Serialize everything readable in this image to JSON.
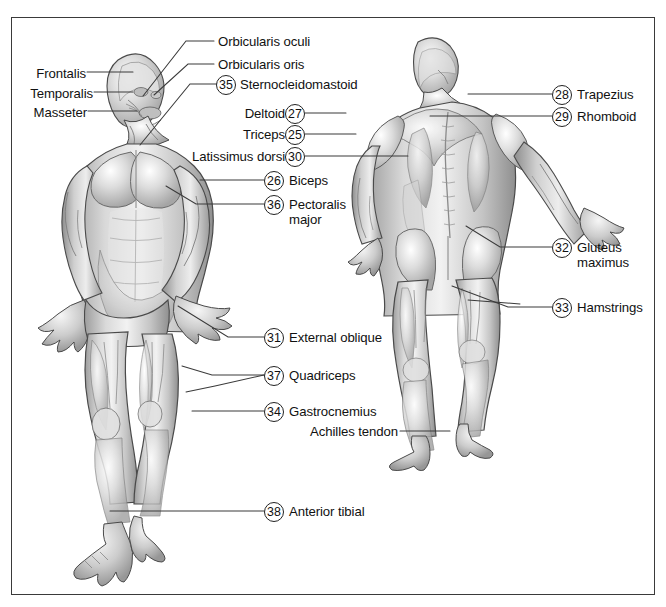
{
  "figure": {
    "border_color": "#3a3a3a",
    "background": "#ffffff",
    "leader_color": "#3a3a3a"
  },
  "views": [
    {
      "name": "anterior-figure",
      "label": "anterior view human muscular figure"
    },
    {
      "name": "posterior-figure",
      "label": "posterior view human muscular figure"
    }
  ],
  "labels": [
    {
      "id": "orbicularis-oculi",
      "text": "Orbicularis oculi",
      "number": null,
      "x": 218,
      "y": 35,
      "align": "left"
    },
    {
      "id": "orbicularis-oris",
      "text": "Orbicularis oris",
      "number": null,
      "x": 218,
      "y": 58,
      "align": "left"
    },
    {
      "id": "sternocleidomastoid",
      "text": "Sternocleidomastoid",
      "number": "35",
      "x": 238,
      "y": 78,
      "align": "left"
    },
    {
      "id": "frontalis",
      "text": "Frontalis",
      "number": null,
      "x": 26,
      "y": 66,
      "align": "left"
    },
    {
      "id": "temporalis",
      "text": "Temporalis",
      "number": null,
      "x": 26,
      "y": 86,
      "align": "left"
    },
    {
      "id": "masseter",
      "text": "Masseter",
      "number": null,
      "x": 26,
      "y": 105,
      "align": "left"
    },
    {
      "id": "trapezius",
      "text": "Trapezius",
      "number": "28",
      "x": 574,
      "y": 88,
      "align": "left"
    },
    {
      "id": "rhomboid",
      "text": "Rhomboid",
      "number": "29",
      "x": 574,
      "y": 110,
      "align": "left"
    },
    {
      "id": "deltoid",
      "text": "Deltoid",
      "number": "27",
      "x": 287,
      "y": 107,
      "align": "right"
    },
    {
      "id": "triceps",
      "text": "Triceps",
      "number": "25",
      "x": 287,
      "y": 128,
      "align": "right"
    },
    {
      "id": "latissimus-dorsi",
      "text": "Latissimus dorsi",
      "number": "30",
      "x": 287,
      "y": 150,
      "align": "right"
    },
    {
      "id": "biceps",
      "text": "Biceps",
      "number": "26",
      "x": 287,
      "y": 174,
      "align": "left"
    },
    {
      "id": "pectoralis-major",
      "text": "Pectoralis major",
      "number": "36",
      "x": 287,
      "y": 198,
      "align": "left"
    },
    {
      "id": "gluteus-maximus",
      "text": "Gluteus maximus",
      "number": "32",
      "x": 574,
      "y": 241,
      "align": "left"
    },
    {
      "id": "hamstrings",
      "text": "Hamstrings",
      "number": "33",
      "x": 574,
      "y": 301,
      "align": "left"
    },
    {
      "id": "external-oblique",
      "text": "External oblique",
      "number": "31",
      "x": 287,
      "y": 331,
      "align": "left"
    },
    {
      "id": "quadriceps",
      "text": "Quadriceps",
      "number": "37",
      "x": 287,
      "y": 369,
      "align": "left"
    },
    {
      "id": "gastrocnemius",
      "text": "Gastrocnemius",
      "number": "34",
      "x": 287,
      "y": 405,
      "align": "left"
    },
    {
      "id": "achilles-tendon",
      "text": "Achilles tendon",
      "number": null,
      "x": 407,
      "y": 425,
      "align": "right"
    },
    {
      "id": "anterior-tibial",
      "text": "Anterior tibial",
      "number": "38",
      "x": 287,
      "y": 505,
      "align": "left"
    }
  ],
  "numbers_used": [
    "25",
    "26",
    "27",
    "28",
    "29",
    "30",
    "31",
    "32",
    "33",
    "34",
    "35",
    "36",
    "37",
    "38"
  ]
}
